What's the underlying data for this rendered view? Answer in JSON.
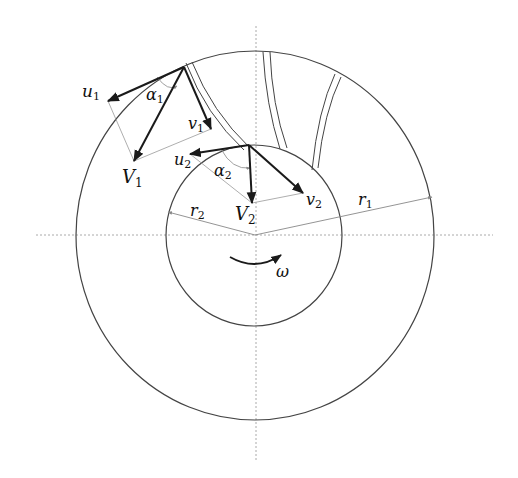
{
  "colors": {
    "background": "#ffffff",
    "outline": "#444444",
    "vector": "#1a1a1a",
    "construction": "#9a9a9a",
    "axis": "#a8a8a8"
  },
  "labels": {
    "u1": {
      "main": "u",
      "sub": "1"
    },
    "alpha1": {
      "main": "α",
      "sub": "1"
    },
    "v1": {
      "main": "v",
      "sub": "1"
    },
    "V1": {
      "main": "V",
      "sub": "1"
    },
    "u2": {
      "main": "u",
      "sub": "2"
    },
    "alpha2": {
      "main": "α",
      "sub": "2"
    },
    "V2": {
      "main": "V",
      "sub": "2"
    },
    "v2": {
      "main": "v",
      "sub": "2"
    },
    "r1": {
      "main": "r",
      "sub": "1"
    },
    "r2": {
      "main": "r",
      "sub": "2"
    },
    "omega": {
      "main": "ω"
    }
  },
  "geometry": {
    "center": [
      255,
      235
    ],
    "outer_radius": [
      179,
      184
    ],
    "inner_radius": [
      88,
      90
    ],
    "inlet_point": [
      184,
      67
    ],
    "outlet_point": [
      249,
      145
    ]
  }
}
